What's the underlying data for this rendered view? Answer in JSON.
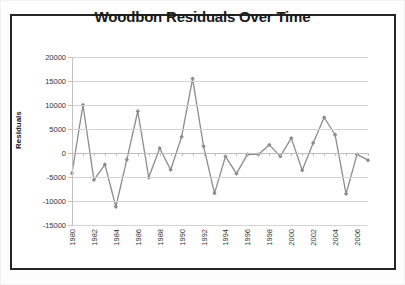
{
  "chart": {
    "title": "Woodbon Residuals Over Time",
    "ylabel": "Residuals"
  },
  "chart_data": {
    "type": "line",
    "title": "Woodbon Residuals Over Time",
    "xlabel": "",
    "ylabel": "Residuals",
    "ylim": [
      -15000,
      20000
    ],
    "xlim": [
      1980,
      2007
    ],
    "grid": true,
    "legend": false,
    "marker": "diamond",
    "line_color": "#8c8c8c",
    "marker_color": "#8c8c8c",
    "ytick_labels": [
      "20000",
      "15000",
      "10000",
      "5000",
      "0",
      "-5000",
      "-10000",
      "-15000"
    ],
    "ytick_values": [
      20000,
      15000,
      10000,
      5000,
      0,
      -5000,
      -10000,
      -15000
    ],
    "xtick_labels": [
      "1980",
      "1982",
      "1984",
      "1986",
      "1988",
      "1990",
      "1992",
      "1994",
      "1996",
      "1998",
      "2000",
      "2002",
      "2004",
      "2006"
    ],
    "xtick_values": [
      1980,
      1982,
      1984,
      1986,
      1988,
      1990,
      1992,
      1994,
      1996,
      1998,
      2000,
      2002,
      2004,
      2006
    ],
    "x": [
      1980,
      1981,
      1982,
      1983,
      1984,
      1985,
      1986,
      1987,
      1988,
      1989,
      1990,
      1991,
      1992,
      1993,
      1994,
      1995,
      1996,
      1997,
      1998,
      1999,
      2000,
      2001,
      2002,
      2003,
      2004,
      2005,
      2006,
      2007
    ],
    "values": [
      -4200,
      10000,
      -5600,
      -2400,
      -11200,
      -1400,
      8700,
      -5100,
      1000,
      -3500,
      3400,
      15500,
      1400,
      -8400,
      -700,
      -4300,
      -300,
      -300,
      1700,
      -700,
      3100,
      -3600,
      2100,
      7400,
      3800,
      -8500,
      -300,
      -1500
    ],
    "series": [
      {
        "name": "Residuals",
        "values": [
          -4200,
          10000,
          -5600,
          -2400,
          -11200,
          -1400,
          8700,
          -5100,
          1000,
          -3500,
          3400,
          15500,
          1400,
          -8400,
          -700,
          -4300,
          -300,
          -300,
          1700,
          -700,
          3100,
          -3600,
          2100,
          7400,
          3800,
          -8500,
          -300,
          -1500
        ]
      }
    ]
  }
}
